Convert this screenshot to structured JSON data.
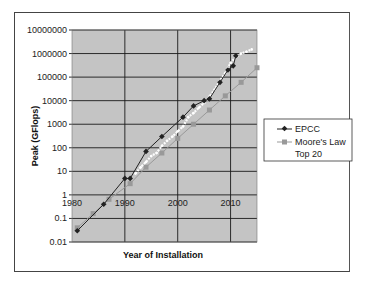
{
  "chart_data": {
    "type": "line",
    "title": "",
    "xlabel": "Year of Installation",
    "ylabel": "Peak (GFlops)",
    "yscale": "log",
    "ylim": [
      0.01,
      10000000
    ],
    "xlim": [
      1980,
      2015
    ],
    "grid": true,
    "legend_position": "right",
    "y_ticks": [
      "10000000",
      "1000000",
      "100000",
      "10000",
      "1000",
      "100",
      "10",
      "1",
      "0.1",
      "0.01"
    ],
    "x_ticks": [
      "1980",
      "1990",
      "2000",
      "2010"
    ],
    "series": [
      {
        "name": "EPCC",
        "color": "#222222",
        "marker": "diamond",
        "points": [
          [
            1981,
            0.03
          ],
          [
            1986,
            0.4
          ],
          [
            1990,
            5
          ],
          [
            1991,
            5
          ],
          [
            1994,
            70
          ],
          [
            1997,
            300
          ],
          [
            2001,
            2000
          ],
          [
            2003,
            6000
          ],
          [
            2005,
            10000
          ],
          [
            2006,
            12000
          ],
          [
            2008,
            60000
          ],
          [
            2009.5,
            200000
          ],
          [
            2010.5,
            300000
          ],
          [
            2011,
            800000
          ]
        ]
      },
      {
        "name": "Moore's Law",
        "color": "#999999",
        "marker": "square",
        "points": [
          [
            1981,
            0.04
          ],
          [
            1984,
            0.16
          ],
          [
            1987,
            0.65
          ],
          [
            1991,
            3
          ],
          [
            1994,
            15
          ],
          [
            1997,
            60
          ],
          [
            2000,
            250
          ],
          [
            2003,
            1000
          ],
          [
            2006,
            4000
          ],
          [
            2009,
            16000
          ],
          [
            2012,
            60000
          ],
          [
            2015,
            250000
          ]
        ]
      },
      {
        "name": "Top 20",
        "color": "#ffffff",
        "marker": "dot",
        "points": [
          [
            1992,
            8
          ],
          [
            1993,
            15
          ],
          [
            1994,
            25
          ],
          [
            1995,
            45
          ],
          [
            1996,
            60
          ],
          [
            1997,
            120
          ],
          [
            1998,
            200
          ],
          [
            1999,
            300
          ],
          [
            2000,
            500
          ],
          [
            2001,
            800
          ],
          [
            2002,
            2000
          ],
          [
            2003,
            3000
          ],
          [
            2004,
            5000
          ],
          [
            2005,
            8000
          ],
          [
            2006,
            15000
          ],
          [
            2007,
            30000
          ],
          [
            2008,
            70000
          ],
          [
            2009,
            150000
          ],
          [
            2010,
            400000
          ],
          [
            2011,
            700000
          ],
          [
            2012,
            1000000
          ],
          [
            2013,
            1200000
          ],
          [
            2014,
            1500000
          ]
        ]
      }
    ]
  },
  "legend": {
    "items": [
      {
        "label": "EPCC"
      },
      {
        "label": "Moore's Law"
      },
      {
        "label": "Top 20"
      }
    ]
  },
  "style": {
    "plot_bg": "#c4c4c4",
    "grid_color": "#1a1a1a"
  }
}
